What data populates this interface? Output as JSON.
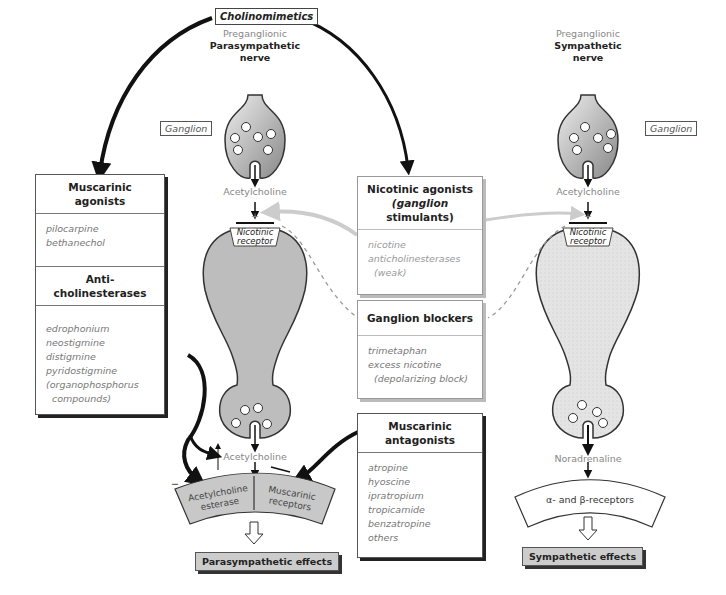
{
  "title": "Cholinomimetics",
  "left_nerve": {
    "pre_label": "Preganglionic",
    "name": "Parasympathetic",
    "suffix": "nerve"
  },
  "right_nerve": {
    "pre_label": "Preganglionic",
    "name": "Sympathetic",
    "suffix": "nerve"
  },
  "ganglion_label_left": "Ganglion",
  "ganglion_label_right": "Ganglion",
  "transmitters": {
    "left_ganglion": "Acetylcholine",
    "right_ganglion": "Acetylcholine",
    "left_terminal": "Acetylcholine",
    "right_terminal": "Noradrenaline"
  },
  "receptors": {
    "nicotinic_left": [
      "Nicotinic",
      "receptor"
    ],
    "nicotinic_right": [
      "Nicotinic",
      "receptor"
    ],
    "ache": [
      "Acetylcholine",
      "esterase"
    ],
    "muscarinic": [
      "Muscarinic",
      "receptors"
    ],
    "adrenergic": "α- and β-receptors"
  },
  "boxes": {
    "muscarinic_agonists": {
      "header": [
        "Muscarinic",
        "agonists"
      ],
      "items": [
        "pilocarpine",
        "bethanechol"
      ]
    },
    "anticholinesterases": {
      "header": [
        "Anti-",
        "cholinesterases"
      ],
      "items": [
        "edrophonium",
        "neostigmine",
        "distigmine",
        "pyridostigmine",
        "(organophosphorus",
        "  compounds)"
      ]
    },
    "nicotinic_agonists": {
      "header": [
        "Nicotinic agonists",
        "(ganglion",
        "stimulants)"
      ],
      "items": [
        "nicotine",
        "anticholinesterases",
        "  (weak)"
      ]
    },
    "ganglion_blockers": {
      "header": [
        "Ganglion blockers"
      ],
      "items": [
        "trimetaphan",
        "excess nicotine",
        "  (depolarizing block)"
      ]
    },
    "muscarinic_antagonists": {
      "header": [
        "Muscarinic",
        "antagonists"
      ],
      "items": [
        "atropine",
        "hyoscine",
        "ipratropium",
        "tropicamide",
        "benzatropine",
        "others"
      ]
    }
  },
  "effects": {
    "parasympathetic": "Parasympathetic effects",
    "sympathetic": "Sympathetic effects"
  },
  "signs": {
    "plus": "+",
    "minus": "−"
  },
  "colors": {
    "neuron_left": "#bdbdbd",
    "neuron_right": "#e2e2e2",
    "receptor_band": "#c8c8c8",
    "effect_box": "#cccccc"
  }
}
